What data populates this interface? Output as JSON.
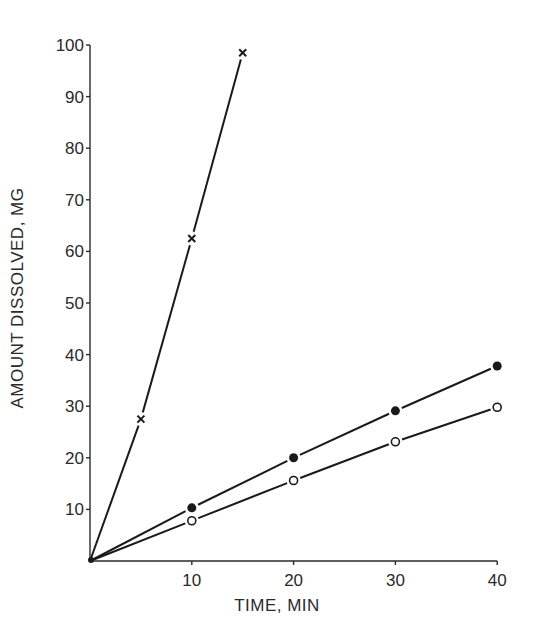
{
  "chart_data": {
    "type": "line",
    "title": "",
    "xlabel": "TIME, MIN",
    "ylabel": "AMOUNT DISSOLVED, MG",
    "xlim": [
      0,
      40
    ],
    "ylim": [
      0,
      100
    ],
    "xticks": [
      10,
      20,
      30,
      40
    ],
    "yticks": [
      10,
      20,
      30,
      40,
      50,
      60,
      70,
      80,
      90,
      100
    ],
    "grid": false,
    "legend": null,
    "series": [
      {
        "name": "cross-markers",
        "marker": "x",
        "x": [
          0,
          5,
          10,
          15
        ],
        "y": [
          0,
          27.5,
          62.5,
          98.5
        ]
      },
      {
        "name": "filled-circles",
        "marker": "filled-circle",
        "x": [
          0,
          10,
          20,
          30,
          40
        ],
        "y": [
          0,
          10.3,
          20.0,
          29.1,
          37.8
        ]
      },
      {
        "name": "open-circles",
        "marker": "open-circle",
        "x": [
          0,
          10,
          20,
          30,
          40
        ],
        "y": [
          0,
          7.8,
          15.6,
          23.1,
          29.8
        ]
      }
    ]
  },
  "axes": {
    "x_label": "TIME, MIN",
    "y_label": "AMOUNT DISSOLVED, MG"
  },
  "colors": {
    "ink": "#1a1a1a",
    "background": "#ffffff"
  }
}
